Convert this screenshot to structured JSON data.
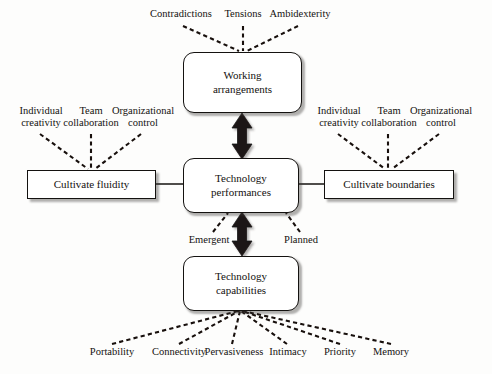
{
  "diagram": {
    "background_color": "#fdfdfc",
    "stroke_color": "#141210",
    "arrow_color": "#1a1816",
    "nodes": {
      "working_arrangements": {
        "label_line1": "Working",
        "label_line2": "arrangements"
      },
      "technology_performances": {
        "label_line1": "Technology",
        "label_line2": "performances"
      },
      "technology_capabilities": {
        "label_line1": "Technology",
        "label_line2": "capabilities"
      },
      "cultivate_fluidity": {
        "label_line1": "Cultivate fluidity",
        "label_line2": ""
      },
      "cultivate_boundaries": {
        "label_line1": "Cultivate boundaries",
        "label_line2": ""
      }
    },
    "top_labels": [
      {
        "line1": "Contradictions",
        "line2": ""
      },
      {
        "line1": "Tensions",
        "line2": ""
      },
      {
        "line1": "Ambidexterity",
        "line2": ""
      }
    ],
    "left_labels": [
      {
        "line1": "Individual",
        "line2": "creativity"
      },
      {
        "line1": "Team",
        "line2": "collaboration"
      },
      {
        "line1": "Organizational",
        "line2": "control"
      }
    ],
    "right_labels": [
      {
        "line1": "Individual",
        "line2": "creativity"
      },
      {
        "line1": "Team",
        "line2": "collaboration"
      },
      {
        "line1": "Organizational",
        "line2": "control"
      }
    ],
    "middle_labels": [
      {
        "line1": "Emergent",
        "line2": ""
      },
      {
        "line1": "Planned",
        "line2": ""
      }
    ],
    "bottom_labels": [
      {
        "line1": "Portability",
        "line2": ""
      },
      {
        "line1": "Connectivity",
        "line2": ""
      },
      {
        "line1": "Pervasiveness",
        "line2": ""
      },
      {
        "line1": "Intimacy",
        "line2": ""
      },
      {
        "line1": "Priority",
        "line2": ""
      },
      {
        "line1": "Memory",
        "line2": ""
      }
    ]
  }
}
